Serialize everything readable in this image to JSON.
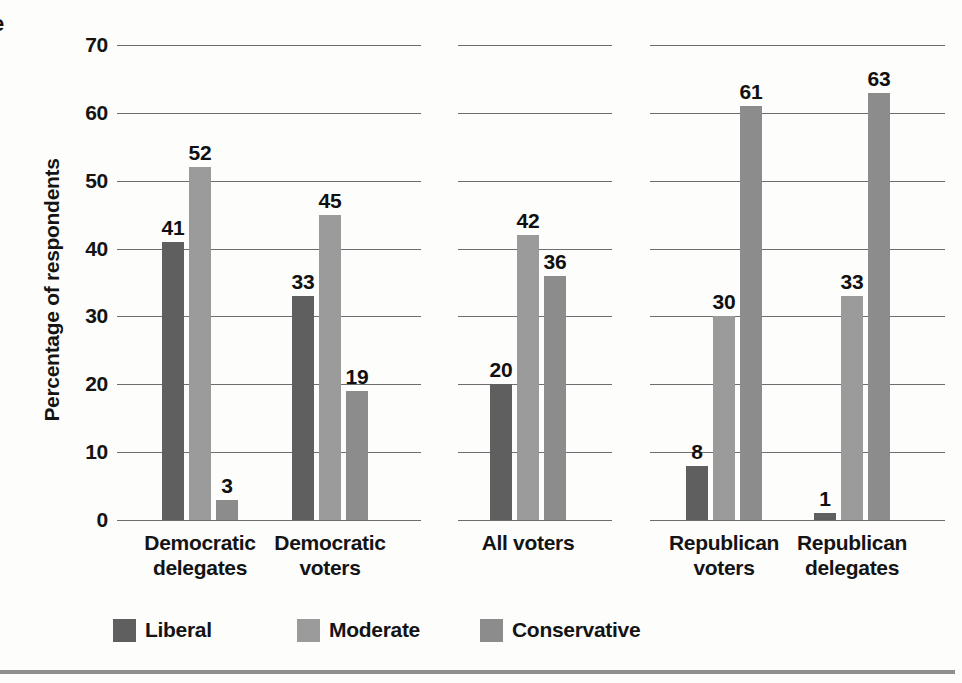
{
  "figure": {
    "partial_edge_text": "e"
  },
  "chart_data": {
    "type": "bar",
    "title": "",
    "xlabel": "",
    "ylabel": "Percentage of respondents",
    "ylim": [
      0,
      70
    ],
    "yticks": [
      0,
      10,
      20,
      30,
      40,
      50,
      60,
      70
    ],
    "grid": true,
    "value_labels": true,
    "legend_position": "bottom",
    "categories": [
      "Democratic delegates",
      "Democratic voters",
      "All voters",
      "Republican voters",
      "Republican delegates"
    ],
    "category_label_lines": [
      [
        "Democratic",
        "delegates"
      ],
      [
        "Democratic",
        "voters"
      ],
      [
        "All voters"
      ],
      [
        "Republican",
        "voters"
      ],
      [
        "Republican",
        "delegates"
      ]
    ],
    "panel_groups": [
      [
        0,
        1
      ],
      [
        2
      ],
      [
        3,
        4
      ]
    ],
    "series": [
      {
        "name": "Liberal",
        "color": "#5f5f5f",
        "values": [
          41,
          33,
          20,
          8,
          1
        ]
      },
      {
        "name": "Moderate",
        "color": "#9b9b9b",
        "values": [
          52,
          45,
          42,
          30,
          33
        ]
      },
      {
        "name": "Conservative",
        "color": "#8c8c8c",
        "values": [
          3,
          19,
          36,
          61,
          63
        ]
      }
    ]
  }
}
